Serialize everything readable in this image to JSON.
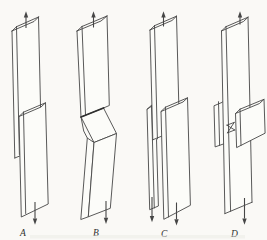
{
  "figure": {
    "background_color": "#faf9f6",
    "line_color": "#464646",
    "label_color": "#2e2e2e",
    "panels": [
      {
        "label": "A",
        "top_arrow_icon": "up-arrow",
        "bottom_arrow_icons": [
          "down-arrow"
        ]
      },
      {
        "label": "B",
        "top_arrow_icon": "up-arrow",
        "bottom_arrow_icons": [
          "down-arrow"
        ]
      },
      {
        "label": "C",
        "top_arrow_icon": "up-arrow",
        "bottom_arrow_icons": [
          "down-arrow",
          "down-arrow"
        ]
      },
      {
        "label": "D",
        "top_arrow_icon": "up-arrow",
        "bottom_arrow_icons": [
          "down-arrow"
        ]
      }
    ]
  }
}
